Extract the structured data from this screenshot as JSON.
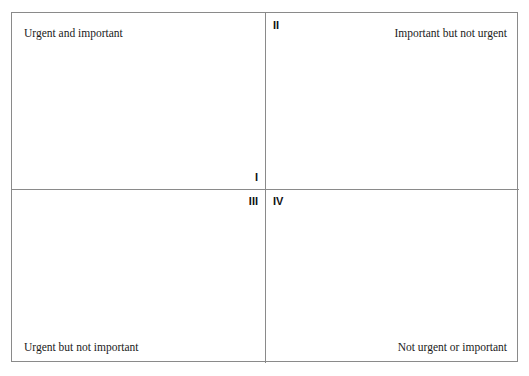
{
  "diagram": {
    "type": "2x2-matrix",
    "colors": {
      "background": "#ffffff",
      "border": "#8a8a8a",
      "text": "#1a1a1a",
      "numeral": "#111111"
    },
    "quadrants": [
      {
        "id": "q1",
        "numeral": "I",
        "label": "Urgent and important",
        "label_position": "top-left",
        "numeral_position": "bottom-right"
      },
      {
        "id": "q2",
        "numeral": "II",
        "label": "Important but not urgent",
        "label_position": "top-right",
        "numeral_position": "top-left"
      },
      {
        "id": "q3",
        "numeral": "III",
        "label": "Urgent but not important",
        "label_position": "bottom-left",
        "numeral_position": "top-right"
      },
      {
        "id": "q4",
        "numeral": "IV",
        "label": "Not urgent or important",
        "label_position": "bottom-right",
        "numeral_position": "top-left"
      }
    ]
  }
}
